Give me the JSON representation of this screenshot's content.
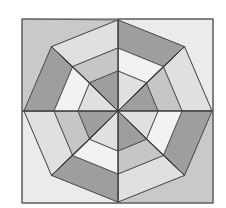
{
  "diagram": {
    "palette": {
      "dark": "#9e9e9e",
      "medium": "#c6c6c6",
      "light": "#e0e0e0",
      "white": "#f2f2f2",
      "corner_dark": "#c9c9c9",
      "corner_light": "#ebebeb",
      "stroke": "#555555"
    },
    "center": [
      118,
      111
    ],
    "frame": {
      "x1": 22,
      "y1": 19,
      "x2": 213,
      "y2": 203
    },
    "rings": [
      {
        "name": "outer",
        "rx": 94,
        "ry": 91
      },
      {
        "name": "middle",
        "rx": 64,
        "ry": 63
      },
      {
        "name": "inner",
        "rx": 40,
        "ry": 40
      }
    ],
    "sectors": [
      {
        "name": "N-NE",
        "outer": "dark",
        "middle": "white",
        "inner": "light"
      },
      {
        "name": "NE-E",
        "outer": "light",
        "middle": "medium",
        "inner": "dark"
      },
      {
        "name": "E-SE",
        "outer": "dark",
        "middle": "white",
        "inner": "light"
      },
      {
        "name": "SE-S",
        "outer": "light",
        "middle": "medium",
        "inner": "dark"
      },
      {
        "name": "S-SW",
        "outer": "dark",
        "middle": "white",
        "inner": "light"
      },
      {
        "name": "SW-W",
        "outer": "light",
        "middle": "medium",
        "inner": "dark"
      },
      {
        "name": "W-NW",
        "outer": "dark",
        "middle": "white",
        "inner": "light"
      },
      {
        "name": "NW-N",
        "outer": "light",
        "middle": "medium",
        "inner": "dark"
      }
    ],
    "corners": {
      "top_left": "corner_dark",
      "top_right": "corner_light",
      "bottom_left": "corner_light",
      "bottom_right": "corner_dark"
    }
  }
}
